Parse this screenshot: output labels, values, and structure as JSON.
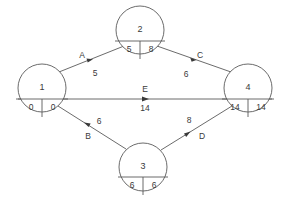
{
  "diagram": {
    "type": "activity-on-arrow-network",
    "title": "",
    "canvas": {
      "width": 283,
      "height": 199
    },
    "colors": {
      "background": "#ffffff",
      "line": "#5a5a5a",
      "text": "#3a3a3a"
    },
    "nodes": [
      {
        "key": "node-1",
        "id": "1",
        "left_value": "0",
        "right_value": "0",
        "cx": 42,
        "cy": 88,
        "r": 24
      },
      {
        "key": "node-2",
        "id": "2",
        "left_value": "5",
        "right_value": "8",
        "cx": 140,
        "cy": 30,
        "r": 24
      },
      {
        "key": "node-3",
        "id": "3",
        "left_value": "6",
        "right_value": "6",
        "cx": 143,
        "cy": 167,
        "r": 24
      },
      {
        "key": "node-4",
        "id": "4",
        "left_value": "14",
        "right_value": "14",
        "cx": 248,
        "cy": 88,
        "r": 24
      },
      {
        "key": "node-5",
        "id": "5",
        "left_value": "",
        "right_value": "",
        "cx": 0,
        "cy": 0,
        "r": 0
      }
    ],
    "edges": [
      {
        "key": "edge-a",
        "name": "A",
        "duration": "5",
        "from": "1",
        "to": "2",
        "name_x": 82,
        "name_y": 58,
        "dur_x": 94,
        "dur_y": 75
      },
      {
        "key": "edge-c",
        "name": "C",
        "duration": "6",
        "from": "2",
        "to": "4",
        "name_x": 200,
        "name_y": 58,
        "dur_x": 187,
        "dur_y": 75
      },
      {
        "key": "edge-e",
        "name": "E",
        "duration": "14",
        "from": "1",
        "to": "4",
        "name_x": 145,
        "name_y": 88,
        "dur_x": 145,
        "dur_y": 108
      },
      {
        "key": "edge-b",
        "name": "B",
        "duration": "6",
        "from": "1",
        "to": "3",
        "name_x": 87,
        "name_y": 137,
        "dur_x": 97,
        "dur_y": 124
      },
      {
        "key": "edge-d",
        "name": "D",
        "duration": "8",
        "from": "3",
        "to": "4",
        "name_x": 201,
        "name_y": 137,
        "dur_x": 190,
        "dur_y": 122
      }
    ]
  }
}
